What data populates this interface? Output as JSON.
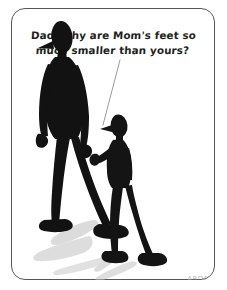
{
  "panel": {
    "caption_line_1": "Dad, why are Mom's feet so",
    "caption_line_2": "much smaller than yours?",
    "signature": "ARDAI",
    "frame_color": "#54585c",
    "background_color": "#ffffff",
    "ink_color": "#121212",
    "shadow_color": "#b4b4b4",
    "text_color": "#1d1f21"
  },
  "figures": {
    "adult": {
      "name": "adult-figure",
      "role": "Dad",
      "description": "tall black silhouette man with elongated head, pointed nose, very long legs and large flat feet, walking right",
      "relative_height": "tall"
    },
    "child": {
      "name": "child-figure",
      "role": "Child",
      "description": "small black silhouette child with rounded head and cap brim, reaching up toward the adult's hand, walking right",
      "relative_height": "short"
    },
    "shadow": {
      "name": "cast-shadow",
      "description": "soft grey shadows cast to the lower-left of both figures"
    }
  }
}
